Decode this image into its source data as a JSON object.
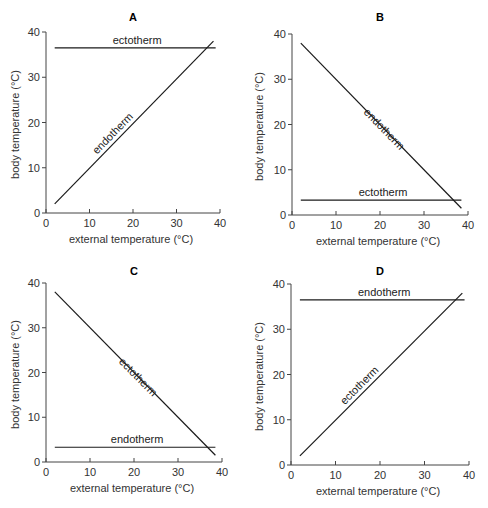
{
  "figure": {
    "panels": [
      "A",
      "B",
      "C",
      "D"
    ]
  },
  "chart_data": [
    {
      "type": "line",
      "title": "A",
      "xlabel": "external temperature (°C)",
      "ylabel": "body temperature (°C)",
      "xlim": [
        0,
        40
      ],
      "ylim": [
        0,
        40
      ],
      "xticks": [
        0,
        10,
        20,
        30,
        40
      ],
      "yticks": [
        0,
        10,
        20,
        30,
        40
      ],
      "grid": false,
      "series": [
        {
          "name": "ectotherm",
          "x": [
            2,
            39
          ],
          "y": [
            36.5,
            36.5
          ],
          "label_pos": "above",
          "orientation": "horizontal"
        },
        {
          "name": "endotherm",
          "x": [
            2,
            38.5
          ],
          "y": [
            2,
            38
          ],
          "label_pos": "along",
          "orientation": "rising"
        }
      ]
    },
    {
      "type": "line",
      "title": "B",
      "xlabel": "external temperature (°C)",
      "ylabel": "body temperature (°C)",
      "xlim": [
        0,
        40
      ],
      "ylim": [
        0,
        40
      ],
      "xticks": [
        0,
        10,
        20,
        30,
        40
      ],
      "yticks": [
        0,
        10,
        20,
        30,
        40
      ],
      "grid": false,
      "series": [
        {
          "name": "endotherm",
          "x": [
            2,
            38.5
          ],
          "y": [
            38,
            1.5
          ],
          "label_pos": "along",
          "orientation": "falling"
        },
        {
          "name": "ectotherm",
          "x": [
            2,
            38.5
          ],
          "y": [
            3.3,
            3.3
          ],
          "label_pos": "above",
          "orientation": "horizontal"
        }
      ]
    },
    {
      "type": "line",
      "title": "C",
      "xlabel": "external temperature (°C)",
      "ylabel": "body temperature (°C)",
      "xlim": [
        0,
        40
      ],
      "ylim": [
        0,
        40
      ],
      "xticks": [
        0,
        10,
        20,
        30,
        40
      ],
      "yticks": [
        0,
        10,
        20,
        30,
        40
      ],
      "grid": false,
      "series": [
        {
          "name": "ectotherm",
          "x": [
            2,
            38.5
          ],
          "y": [
            38,
            1.5
          ],
          "label_pos": "along",
          "orientation": "falling"
        },
        {
          "name": "endotherm",
          "x": [
            2,
            38.5
          ],
          "y": [
            3.3,
            3.3
          ],
          "label_pos": "above",
          "orientation": "horizontal"
        }
      ]
    },
    {
      "type": "line",
      "title": "D",
      "xlabel": "external temperature (°C)",
      "ylabel": "body temperature (°C)",
      "xlim": [
        0,
        40
      ],
      "ylim": [
        0,
        40
      ],
      "xticks": [
        0,
        10,
        20,
        30,
        40
      ],
      "yticks": [
        0,
        10,
        20,
        30,
        40
      ],
      "grid": false,
      "series": [
        {
          "name": "endotherm",
          "x": [
            2,
            39
          ],
          "y": [
            36.5,
            36.5
          ],
          "label_pos": "above",
          "orientation": "horizontal"
        },
        {
          "name": "ectotherm",
          "x": [
            2,
            38.5
          ],
          "y": [
            2,
            38
          ],
          "label_pos": "along",
          "orientation": "rising"
        }
      ]
    }
  ],
  "layout": {
    "panels": [
      {
        "left": 0,
        "top": 0,
        "ox": 46,
        "oy": 213,
        "w": 174,
        "h": 181
      },
      {
        "left": 244,
        "top": 0,
        "ox": 48,
        "oy": 215,
        "w": 176,
        "h": 181
      },
      {
        "left": 0,
        "top": 254,
        "ox": 46,
        "oy": 208,
        "w": 176,
        "h": 179
      },
      {
        "left": 244,
        "top": 254,
        "ox": 47,
        "oy": 211,
        "w": 178,
        "h": 181
      }
    ],
    "line_color": "#1a1a1a",
    "axis_color": "#444444"
  }
}
